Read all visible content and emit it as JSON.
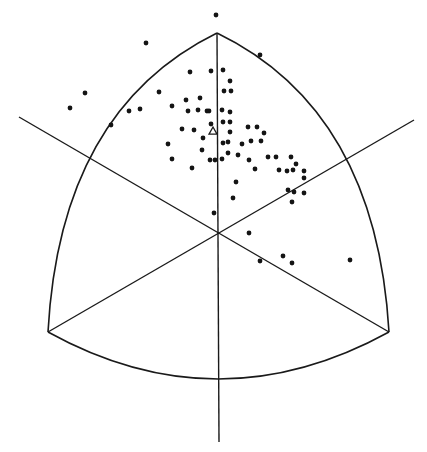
{
  "diagram": {
    "type": "spherical-triangle-projection",
    "width": 427,
    "height": 452,
    "colors": {
      "background": "#ffffff",
      "stroke": "#1a1a1a",
      "dot": "#141414"
    },
    "frame": {
      "top_vertex": [
        217,
        33
      ],
      "bottom_left_vertex": [
        48,
        332
      ],
      "bottom_right_vertex": [
        389,
        332
      ],
      "center": [
        218,
        233
      ],
      "bottom_arc_mid": [
        218,
        379
      ]
    },
    "lines": [
      {
        "name": "vertical-axis",
        "x1": 217,
        "y1": 33,
        "x2": 219,
        "y2": 442
      },
      {
        "name": "left-diagonal",
        "x1": 19,
        "y1": 117,
        "x2": 389,
        "y2": 332
      },
      {
        "name": "right-diagonal",
        "x1": 414,
        "y1": 120,
        "x2": 48,
        "y2": 332
      }
    ],
    "marker": {
      "name": "triangle-marker",
      "symbol": "open-triangle",
      "x": 213,
      "y": 131
    },
    "points": [
      [
        216,
        15
      ],
      [
        146,
        43
      ],
      [
        260,
        55
      ],
      [
        190,
        72
      ],
      [
        211,
        71
      ],
      [
        223,
        70
      ],
      [
        85,
        93
      ],
      [
        159,
        92
      ],
      [
        172,
        106
      ],
      [
        230,
        81
      ],
      [
        224,
        91
      ],
      [
        231,
        91
      ],
      [
        70,
        108
      ],
      [
        129,
        111
      ],
      [
        140,
        109
      ],
      [
        186,
        100
      ],
      [
        200,
        98
      ],
      [
        207,
        111
      ],
      [
        222,
        110
      ],
      [
        230,
        112
      ],
      [
        111,
        125
      ],
      [
        188,
        111
      ],
      [
        198,
        110
      ],
      [
        209,
        111
      ],
      [
        223,
        122
      ],
      [
        230,
        122
      ],
      [
        211,
        124
      ],
      [
        230,
        132
      ],
      [
        228,
        142
      ],
      [
        223,
        143
      ],
      [
        194,
        130
      ],
      [
        182,
        129
      ],
      [
        168,
        144
      ],
      [
        203,
        138
      ],
      [
        202,
        150
      ],
      [
        172,
        159
      ],
      [
        192,
        168
      ],
      [
        210,
        160
      ],
      [
        215,
        160
      ],
      [
        222,
        159
      ],
      [
        248,
        127
      ],
      [
        257,
        127
      ],
      [
        264,
        133
      ],
      [
        242,
        144
      ],
      [
        251,
        141
      ],
      [
        261,
        141
      ],
      [
        228,
        153
      ],
      [
        238,
        155
      ],
      [
        236,
        182
      ],
      [
        249,
        160
      ],
      [
        233,
        198
      ],
      [
        268,
        157
      ],
      [
        276,
        157
      ],
      [
        291,
        157
      ],
      [
        296,
        164
      ],
      [
        287,
        171
      ],
      [
        304,
        171
      ],
      [
        255,
        169
      ],
      [
        279,
        170
      ],
      [
        293,
        170
      ],
      [
        304,
        178
      ],
      [
        288,
        190
      ],
      [
        294,
        192
      ],
      [
        304,
        193
      ],
      [
        292,
        202
      ],
      [
        214,
        213
      ],
      [
        249,
        233
      ],
      [
        260,
        261
      ],
      [
        283,
        256
      ],
      [
        292,
        263
      ],
      [
        350,
        260
      ]
    ]
  }
}
